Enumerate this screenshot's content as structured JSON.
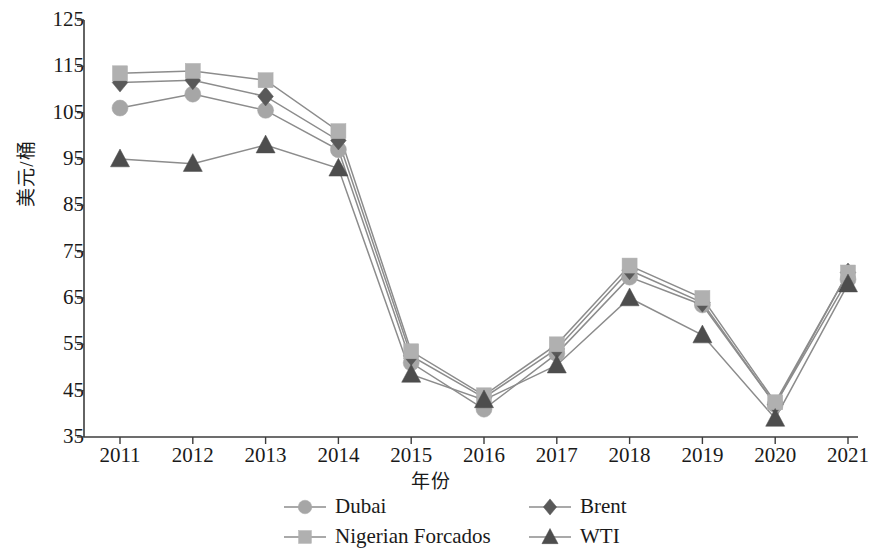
{
  "chart_data": {
    "type": "line",
    "title": "",
    "xlabel": "年份",
    "ylabel": "美元/桶",
    "categories": [
      "2011",
      "2012",
      "2013",
      "2014",
      "2015",
      "2016",
      "2017",
      "2018",
      "2019",
      "2020",
      "2021"
    ],
    "x": [
      2011,
      2012,
      2013,
      2014,
      2015,
      2016,
      2017,
      2018,
      2019,
      2020,
      2021
    ],
    "ylim": [
      35,
      125
    ],
    "yticks": [
      35,
      45,
      55,
      65,
      75,
      85,
      95,
      105,
      115,
      125
    ],
    "grid": false,
    "legend_position": "bottom",
    "series": [
      {
        "name": "Dubai",
        "marker": "circle",
        "color": "#a6a6a6",
        "values": [
          106.0,
          109.0,
          105.5,
          97.0,
          51.0,
          41.0,
          53.0,
          69.5,
          63.5,
          42.0,
          69.0
        ]
      },
      {
        "name": "Brent",
        "marker": "diamond",
        "color": "#595959",
        "values": [
          111.5,
          112.0,
          108.5,
          99.0,
          52.5,
          43.5,
          54.0,
          71.0,
          64.0,
          42.0,
          70.5
        ]
      },
      {
        "name": "Nigerian Forcados",
        "marker": "square",
        "color": "#b0b0b0",
        "values": [
          113.5,
          114.0,
          112.0,
          101.0,
          53.5,
          44.0,
          55.0,
          72.0,
          65.0,
          42.5,
          70.5
        ]
      },
      {
        "name": "WTI",
        "marker": "triangle",
        "color": "#4d4d4d",
        "values": [
          95.0,
          94.0,
          98.0,
          93.0,
          48.5,
          43.0,
          50.5,
          65.0,
          57.0,
          39.0,
          68.0
        ]
      }
    ]
  },
  "axis": {
    "y_tick_labels": [
      "125",
      "115",
      "105",
      "95",
      "85",
      "75",
      "65",
      "55",
      "45",
      "35"
    ],
    "x_tick_labels": [
      "2011",
      "2012",
      "2013",
      "2014",
      "2015",
      "2016",
      "2017",
      "2018",
      "2019",
      "2020",
      "2021"
    ],
    "y_axis_title": "美元/桶",
    "x_axis_title": "年份"
  },
  "legend": {
    "entries": [
      {
        "label": "Dubai",
        "marker": "circle",
        "color": "#a6a6a6"
      },
      {
        "label": "Brent",
        "marker": "diamond",
        "color": "#595959"
      },
      {
        "label": "Nigerian Forcados",
        "marker": "square",
        "color": "#b0b0b0"
      },
      {
        "label": "WTI",
        "marker": "triangle",
        "color": "#4d4d4d"
      }
    ]
  },
  "colors": {
    "axis": "#3d3d3d",
    "line": "#8c8c8c",
    "background": "#ffffff",
    "text": "#1a1a1a"
  }
}
